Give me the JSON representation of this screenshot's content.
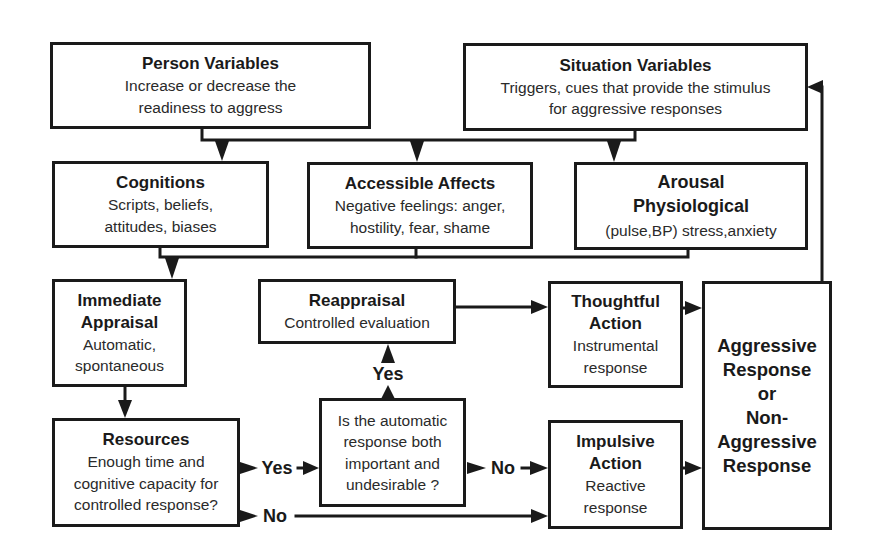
{
  "boxes": {
    "person_variables": {
      "title": [
        "Person Variables"
      ],
      "body": [
        "Increase or decrease the",
        "readiness to aggress"
      ]
    },
    "situation_variables": {
      "title": [
        "Situation Variables"
      ],
      "body": [
        "Triggers, cues that provide the stimulus",
        "for aggressive responses"
      ]
    },
    "cognitions": {
      "title": [
        "Cognitions"
      ],
      "body": [
        "Scripts, beliefs,",
        "attitudes, biases"
      ]
    },
    "accessible_affects": {
      "title": [
        "Accessible Affects"
      ],
      "body": [
        "Negative feelings: anger,",
        "hostility, fear, shame"
      ]
    },
    "arousal": {
      "title": [
        "Arousal",
        "Physiological"
      ],
      "body": [
        "(pulse,BP) stress,anxiety"
      ]
    },
    "immediate_appraisal": {
      "title": [
        "Immediate",
        "Appraisal"
      ],
      "body": [
        "Automatic,",
        "spontaneous"
      ]
    },
    "reappraisal": {
      "title": [
        "Reappraisal"
      ],
      "body": [
        "Controlled evaluation"
      ]
    },
    "thoughtful_action": {
      "title": [
        "Thoughtful",
        "Action"
      ],
      "body": [
        "Instrumental",
        "response"
      ]
    },
    "aggressive_response": {
      "title": [
        "Aggressive",
        "Response",
        "or",
        "Non-",
        "Aggressive",
        "Response"
      ]
    },
    "resources": {
      "title": [
        "Resources"
      ],
      "body": [
        "Enough time and",
        "cognitive capacity for",
        "controlled response?"
      ]
    },
    "decision_question": {
      "body": [
        "Is the automatic",
        "response both",
        "important and",
        "undesirable ?"
      ]
    },
    "impulsive_action": {
      "title": [
        "Impulsive",
        "Action"
      ],
      "body": [
        "Reactive",
        "response"
      ]
    }
  },
  "edge_labels": {
    "decision_to_reappraisal": "Yes",
    "resources_to_decision": "Yes",
    "decision_to_impulsive": "No",
    "resources_to_impulsive": "No"
  },
  "colors": {
    "line": "#1a1a1a",
    "text": "#1f1f1f",
    "background": "#ffffff"
  }
}
